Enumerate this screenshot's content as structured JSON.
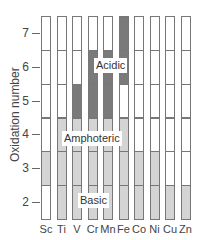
{
  "chart_data": {
    "type": "table",
    "title": "",
    "xlabel": "",
    "ylabel": "Oxidation number",
    "categories": [
      "Sc",
      "Ti",
      "V",
      "Cr",
      "Mn",
      "Fe",
      "Co",
      "Ni",
      "Cu",
      "Zn"
    ],
    "y_ticks": [
      2,
      3,
      4,
      5,
      6,
      7
    ],
    "ylim": [
      1.5,
      7.5
    ],
    "legend_regions": [
      "Acidic",
      "Amphoteric",
      "Basic"
    ],
    "colors": {
      "acidic": "#7a7a7a",
      "amphoteric": "#d4d4d4",
      "basic": "#d4d4d4",
      "none": "#ffffff",
      "border": "#777777"
    },
    "oxide_character": {
      "Sc": {
        "2": "none",
        "3": "basic",
        "4": "none",
        "5": "none",
        "6": "none",
        "7": "none"
      },
      "Ti": {
        "2": "basic",
        "3": "basic",
        "4": "amphoteric",
        "5": "none",
        "6": "none",
        "7": "none"
      },
      "V": {
        "2": "basic",
        "3": "basic",
        "4": "amphoteric",
        "5": "acidic",
        "6": "none",
        "7": "none"
      },
      "Cr": {
        "2": "basic",
        "3": "basic",
        "4": "amphoteric",
        "5": "acidic",
        "6": "acidic",
        "7": "none"
      },
      "Mn": {
        "2": "basic",
        "3": "basic",
        "4": "amphoteric",
        "5": "acidic",
        "6": "acidic",
        "7": "none"
      },
      "Fe": {
        "2": "basic",
        "3": "basic",
        "4": "amphoteric",
        "5": "none",
        "6": "acidic",
        "7": "acidic"
      },
      "Co": {
        "2": "basic",
        "3": "basic",
        "4": "none",
        "5": "none",
        "6": "none",
        "7": "none"
      },
      "Ni": {
        "2": "basic",
        "3": "basic",
        "4": "none",
        "5": "none",
        "6": "none",
        "7": "none"
      },
      "Cu": {
        "2": "basic",
        "3": "none",
        "4": "none",
        "5": "none",
        "6": "none",
        "7": "none"
      },
      "Zn": {
        "2": "basic",
        "3": "none",
        "4": "none",
        "5": "none",
        "6": "none",
        "7": "none"
      }
    },
    "grid": false,
    "legend_position": "inline"
  },
  "labels": {
    "ylabel": "Oxidation number",
    "acidic": "Acidic",
    "amphoteric": "Amphoteric",
    "basic": "Basic"
  }
}
